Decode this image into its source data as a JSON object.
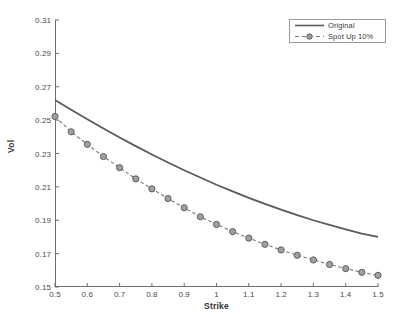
{
  "chart_data": {
    "type": "line",
    "title": "",
    "xlabel": "Strike",
    "ylabel": "Vol",
    "xlim": [
      0.5,
      1.5
    ],
    "ylim": [
      0.15,
      0.31
    ],
    "xticks": [
      "0.5",
      "0.6",
      "0.7",
      "0.8",
      "0.9",
      "1",
      "1.1",
      "1.2",
      "1.3",
      "1.4",
      "1.5"
    ],
    "xtick_values": [
      0.5,
      0.6,
      0.7,
      0.8,
      0.9,
      1.0,
      1.1,
      1.2,
      1.3,
      1.4,
      1.5
    ],
    "yticks": [
      "0.15",
      "0.17",
      "0.19",
      "0.21",
      "0.23",
      "0.25",
      "0.27",
      "0.29",
      "0.31"
    ],
    "ytick_values": [
      0.15,
      0.17,
      0.19,
      0.21,
      0.23,
      0.25,
      0.27,
      0.29,
      0.31
    ],
    "grid": false,
    "legend_position": "top-right",
    "series": [
      {
        "name": "Original",
        "style": "solid",
        "color": "#5a5a5a",
        "marker": "none",
        "x": [
          0.5,
          0.55,
          0.6,
          0.65,
          0.7,
          0.75,
          0.8,
          0.85,
          0.9,
          0.95,
          1.0,
          1.05,
          1.1,
          1.15,
          1.2,
          1.25,
          1.3,
          1.35,
          1.4,
          1.45,
          1.5
        ],
        "values": [
          0.262,
          0.2562,
          0.2505,
          0.245,
          0.2396,
          0.2344,
          0.2294,
          0.2246,
          0.22,
          0.2156,
          0.2113,
          0.2073,
          0.2034,
          0.1998,
          0.1964,
          0.1931,
          0.19,
          0.1872,
          0.1845,
          0.182,
          0.18
        ]
      },
      {
        "name": "Spot Up 10%",
        "style": "dashed",
        "color": "#777777",
        "marker": "circle",
        "x": [
          0.5,
          0.55,
          0.6,
          0.65,
          0.7,
          0.75,
          0.8,
          0.85,
          0.9,
          0.95,
          1.0,
          1.05,
          1.1,
          1.15,
          1.2,
          1.25,
          1.3,
          1.35,
          1.4,
          1.45,
          1.5
        ],
        "values": [
          0.2522,
          0.243,
          0.2355,
          0.2282,
          0.2215,
          0.2148,
          0.2088,
          0.203,
          0.1975,
          0.1921,
          0.1875,
          0.1832,
          0.1793,
          0.1756,
          0.1722,
          0.169,
          0.1662,
          0.1635,
          0.161,
          0.1588,
          0.157
        ]
      }
    ]
  },
  "legend": {
    "entries": [
      {
        "label": "Original"
      },
      {
        "label": "Spot Up 10%"
      }
    ]
  },
  "axis": {
    "x_title": "Strike",
    "y_title": "Vol"
  }
}
